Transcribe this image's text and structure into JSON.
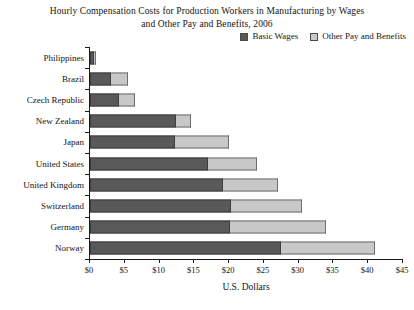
{
  "chart_data": {
    "type": "bar",
    "orientation": "horizontal",
    "stacked": true,
    "title": "Hourly Compensation Costs for Production Workers in Manufacturing by Wages and Other Pay and Benefits, 2006",
    "title_lines": [
      "Hourly Compensation Costs for Production Workers in Manufacturing by Wages",
      "and Other Pay and Benefits, 2006"
    ],
    "xlabel": "U.S. Dollars",
    "ylabel": "",
    "xlim": [
      0,
      45
    ],
    "xticks": [
      0,
      5,
      10,
      15,
      20,
      25,
      30,
      35,
      40,
      45
    ],
    "xtick_labels": [
      "$0",
      "$5",
      "$10",
      "$15",
      "$20",
      "$25",
      "$30",
      "$35",
      "$40",
      "$45"
    ],
    "grid": false,
    "legend_position": "top-right",
    "categories": [
      "Philippines",
      "Brazil",
      "Czech Republic",
      "New Zealand",
      "Japan",
      "United States",
      "United Kingdom",
      "Switzerland",
      "Germany",
      "Norway"
    ],
    "series": [
      {
        "name": "Basic Wages",
        "color": "#595959",
        "values": [
          0.6,
          3.0,
          4.1,
          12.4,
          12.2,
          17.0,
          19.1,
          20.2,
          20.1,
          27.4
        ]
      },
      {
        "name": "Other Pay and Benefits",
        "color": "#c8c8c8",
        "values": [
          0.2,
          2.5,
          2.4,
          2.1,
          7.8,
          7.0,
          7.9,
          10.3,
          13.9,
          13.6
        ]
      }
    ],
    "totals": [
      0.8,
      5.5,
      6.5,
      14.5,
      20.0,
      24.0,
      27.0,
      30.5,
      34.0,
      41.0
    ]
  },
  "legend": {
    "items": [
      {
        "label": "Basic Wages",
        "color": "#595959"
      },
      {
        "label": "Other Pay and Benefits",
        "color": "#c8c8c8"
      }
    ]
  }
}
